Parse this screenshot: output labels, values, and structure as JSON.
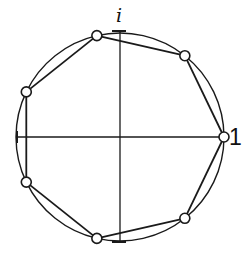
{
  "diagram": {
    "labels": {
      "imaginary_unit": "i",
      "real_unit": "1"
    },
    "center": [
      120,
      137
    ],
    "radius": 104,
    "n_points": 7,
    "stroke_color": "#1a1a1a",
    "node_fill": "#ffffff"
  }
}
